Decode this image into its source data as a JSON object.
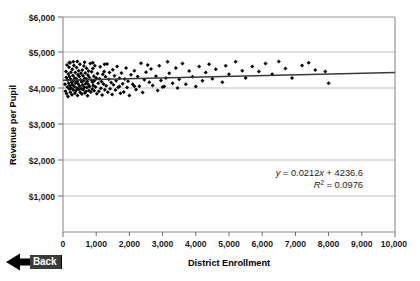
{
  "chart_data": {
    "type": "scatter",
    "title": "",
    "xlabel": "District Enrollment",
    "ylabel": "Revenue per Pupil",
    "xlim": [
      0,
      10000
    ],
    "ylim": [
      0,
      6000
    ],
    "grid": true,
    "legend": "none",
    "x_ticks": [
      "0",
      "1,000",
      "2,000",
      "3,000",
      "4,000",
      "5,000",
      "6,000",
      "7,000",
      "8,000",
      "9,000",
      "10,000"
    ],
    "x_tick_values": [
      0,
      1000,
      2000,
      3000,
      4000,
      5000,
      6000,
      7000,
      8000,
      9000,
      10000
    ],
    "y_ticks": [
      "$1,000",
      "$2,000",
      "$3,000",
      "$4,000",
      "$5,000",
      "$6,000"
    ],
    "y_tick_values": [
      1000,
      2000,
      3000,
      4000,
      5000,
      6000
    ],
    "marker": "diamond",
    "marker_color": "#000000",
    "trendline": {
      "slope": 0.0212,
      "intercept": 4236.6,
      "color": "#3a3a3a",
      "equation_label": "y = 0.0212x + 4236.6",
      "r_squared_value": "0.0976",
      "r_squared_label": "R2 = 0.0976"
    },
    "annotations": [
      {
        "name": "regression-equation",
        "text": "y = 0.0212x + 4236.6"
      },
      {
        "name": "r-squared",
        "text": "R² = 0.0976"
      }
    ],
    "points": [
      [
        60,
        4120
      ],
      [
        75,
        3930
      ],
      [
        90,
        4480
      ],
      [
        100,
        4310
      ],
      [
        110,
        3860
      ],
      [
        120,
        4660
      ],
      [
        130,
        4050
      ],
      [
        140,
        4240
      ],
      [
        150,
        3780
      ],
      [
        160,
        4410
      ],
      [
        170,
        4150
      ],
      [
        180,
        4600
      ],
      [
        190,
        3990
      ],
      [
        200,
        4330
      ],
      [
        210,
        4080
      ],
      [
        215,
        4720
      ],
      [
        220,
        3900
      ],
      [
        230,
        4260
      ],
      [
        240,
        4460
      ],
      [
        250,
        4010
      ],
      [
        260,
        4180
      ],
      [
        270,
        3830
      ],
      [
        280,
        4540
      ],
      [
        290,
        4110
      ],
      [
        300,
        4370
      ],
      [
        310,
        3960
      ],
      [
        320,
        4230
      ],
      [
        330,
        4650
      ],
      [
        340,
        4060
      ],
      [
        350,
        4300
      ],
      [
        360,
        3870
      ],
      [
        370,
        4450
      ],
      [
        380,
        4160
      ],
      [
        390,
        3940
      ],
      [
        400,
        4280
      ],
      [
        410,
        4590
      ],
      [
        420,
        4020
      ],
      [
        430,
        4210
      ],
      [
        440,
        3810
      ],
      [
        450,
        4390
      ],
      [
        460,
        4130
      ],
      [
        470,
        4500
      ],
      [
        480,
        3980
      ],
      [
        490,
        4340
      ],
      [
        500,
        4070
      ],
      [
        510,
        4680
      ],
      [
        520,
        3890
      ],
      [
        530,
        4250
      ],
      [
        540,
        4430
      ],
      [
        550,
        4000
      ],
      [
        560,
        4190
      ],
      [
        570,
        3850
      ],
      [
        580,
        4520
      ],
      [
        590,
        4100
      ],
      [
        600,
        4360
      ],
      [
        610,
        3970
      ],
      [
        620,
        4220
      ],
      [
        630,
        4630
      ],
      [
        640,
        4040
      ],
      [
        650,
        4290
      ],
      [
        660,
        3880
      ],
      [
        670,
        4440
      ],
      [
        680,
        4140
      ],
      [
        690,
        3920
      ],
      [
        700,
        4270
      ],
      [
        710,
        4570
      ],
      [
        720,
        4030
      ],
      [
        730,
        4200
      ],
      [
        740,
        3800
      ],
      [
        750,
        4380
      ],
      [
        760,
        4120
      ],
      [
        770,
        4490
      ],
      [
        780,
        3950
      ],
      [
        790,
        4320
      ],
      [
        800,
        4060
      ],
      [
        820,
        4700
      ],
      [
        840,
        3910
      ],
      [
        850,
        4240
      ],
      [
        860,
        4470
      ],
      [
        880,
        3990
      ],
      [
        890,
        4180
      ],
      [
        900,
        4560
      ],
      [
        910,
        4090
      ],
      [
        930,
        4350
      ],
      [
        940,
        3940
      ],
      [
        950,
        4230
      ],
      [
        960,
        4640
      ],
      [
        980,
        4050
      ],
      [
        1000,
        4300
      ],
      [
        1020,
        3860
      ],
      [
        1040,
        4420
      ],
      [
        1060,
        4150
      ],
      [
        1080,
        3930
      ],
      [
        1100,
        4280
      ],
      [
        1120,
        4610
      ],
      [
        1140,
        4010
      ],
      [
        1160,
        4200
      ],
      [
        1180,
        3820
      ],
      [
        1200,
        4400
      ],
      [
        1220,
        4130
      ],
      [
        1240,
        4480
      ],
      [
        1260,
        3970
      ],
      [
        1280,
        4330
      ],
      [
        1300,
        4080
      ],
      [
        1330,
        4690
      ],
      [
        1350,
        3900
      ],
      [
        1380,
        4260
      ],
      [
        1400,
        4450
      ],
      [
        1420,
        4000
      ],
      [
        1450,
        4170
      ],
      [
        1480,
        3840
      ],
      [
        1500,
        4530
      ],
      [
        1520,
        4110
      ],
      [
        1550,
        4360
      ],
      [
        1580,
        3960
      ],
      [
        1600,
        4220
      ],
      [
        1630,
        4620
      ],
      [
        1660,
        4040
      ],
      [
        1700,
        4290
      ],
      [
        1730,
        3870
      ],
      [
        1760,
        4440
      ],
      [
        1800,
        4140
      ],
      [
        1830,
        3910
      ],
      [
        1860,
        4270
      ],
      [
        1900,
        4580
      ],
      [
        1930,
        4030
      ],
      [
        1960,
        4210
      ],
      [
        2000,
        3810
      ],
      [
        2050,
        4390
      ],
      [
        2100,
        4120
      ],
      [
        2150,
        4500
      ],
      [
        2200,
        3980
      ],
      [
        2250,
        4340
      ],
      [
        2300,
        4070
      ],
      [
        2350,
        4710
      ],
      [
        2400,
        3890
      ],
      [
        2450,
        4250
      ],
      [
        2500,
        4460
      ],
      [
        2550,
        4660
      ],
      [
        2600,
        4180
      ],
      [
        2650,
        4550
      ],
      [
        2700,
        4090
      ],
      [
        2800,
        4350
      ],
      [
        2850,
        3950
      ],
      [
        2900,
        4640
      ],
      [
        2950,
        4230
      ],
      [
        3000,
        4050
      ],
      [
        3100,
        4300
      ],
      [
        3150,
        4750
      ],
      [
        3200,
        4430
      ],
      [
        3300,
        4150
      ],
      [
        3400,
        4580
      ],
      [
        3450,
        4020
      ],
      [
        3500,
        4260
      ],
      [
        3600,
        4700
      ],
      [
        3700,
        4120
      ],
      [
        3800,
        4490
      ],
      [
        3900,
        4330
      ],
      [
        4000,
        4060
      ],
      [
        4100,
        4620
      ],
      [
        4200,
        4220
      ],
      [
        4300,
        4450
      ],
      [
        4400,
        4680
      ],
      [
        4500,
        4280
      ],
      [
        4600,
        4540
      ],
      [
        4800,
        4180
      ],
      [
        4900,
        4640
      ],
      [
        5000,
        4400
      ],
      [
        5200,
        4750
      ],
      [
        5400,
        4500
      ],
      [
        5500,
        4300
      ],
      [
        5700,
        4620
      ],
      [
        5900,
        4480
      ],
      [
        6100,
        4700
      ],
      [
        6300,
        4400
      ],
      [
        6500,
        4760
      ],
      [
        6700,
        4560
      ],
      [
        6900,
        4300
      ],
      [
        7200,
        4650
      ],
      [
        7400,
        4720
      ],
      [
        7600,
        4520
      ],
      [
        7900,
        4480
      ],
      [
        8000,
        4150
      ],
      [
        1700,
        4060
      ],
      [
        2150,
        4070
      ],
      [
        3050,
        4060
      ],
      [
        1250,
        4680
      ],
      [
        900,
        4720
      ],
      [
        650,
        4740
      ],
      [
        430,
        4760
      ],
      [
        310,
        4750
      ],
      [
        190,
        4730
      ]
    ]
  },
  "controls": {
    "back_button": {
      "label": "Back",
      "icon": "left-arrow-icon"
    }
  }
}
